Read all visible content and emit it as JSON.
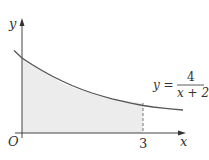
{
  "diagram": {
    "type": "function-graph-shaded-area",
    "function": "y = 4/(x+2)",
    "axes": {
      "x_label": "x",
      "y_label": "y",
      "origin_label": "O",
      "x_ticks": [
        {
          "value": 3,
          "label": "3"
        }
      ]
    },
    "equation_label": {
      "lhs": "y =",
      "numerator": "4",
      "denominator": "x + 2"
    },
    "shaded_region": {
      "from_x": 0,
      "to_x": 3,
      "description": "area under curve between x=0 and x=3"
    },
    "dashed_line_at_x": 3,
    "colors": {
      "curve": "#555555",
      "axes": "#444444",
      "shading": "#ececec",
      "text": "#333333"
    }
  }
}
